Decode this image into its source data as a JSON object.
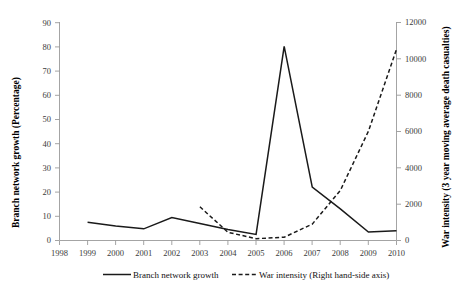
{
  "chart_data": {
    "type": "line",
    "title": "",
    "xlabel": "",
    "ylabel": "Branch network growth (Percentage)",
    "y2label": "War intensity (3 year moving average death casualties)",
    "x": [
      1998,
      1999,
      2000,
      2001,
      2002,
      2003,
      2004,
      2005,
      2006,
      2007,
      2008,
      2009,
      2010
    ],
    "xtick_labels": [
      "1998",
      "1999",
      "2000",
      "2001",
      "2002",
      "2003",
      "2004",
      "2005",
      "2006",
      "2007",
      "2008",
      "2009",
      "2010"
    ],
    "xlim": [
      1998,
      2010
    ],
    "ylim": [
      0,
      90
    ],
    "ytick_labels": [
      "0",
      "10",
      "20",
      "30",
      "40",
      "50",
      "60",
      "70",
      "80",
      "90"
    ],
    "ytick_values": [
      0,
      10,
      20,
      30,
      40,
      50,
      60,
      70,
      80,
      90
    ],
    "y2lim": [
      0,
      12000
    ],
    "y2tick_labels": [
      "0",
      "2000",
      "4000",
      "6000",
      "8000",
      "10000",
      "12000"
    ],
    "y2tick_values": [
      0,
      2000,
      4000,
      6000,
      8000,
      10000,
      12000
    ],
    "grid": false,
    "legend_position": "bottom",
    "series": [
      {
        "name": "Branch network growth",
        "axis": "left",
        "style": "solid",
        "color": "#1a1a1a",
        "x": [
          1999,
          2000,
          2001,
          2002,
          2003,
          2004,
          2005,
          2006,
          2007,
          2008,
          2009,
          2010
        ],
        "values": [
          7.5,
          6.0,
          4.8,
          9.5,
          7.0,
          4.5,
          2.5,
          80.0,
          22.0,
          13.0,
          3.5,
          4.0
        ]
      },
      {
        "name": "War intensity (Right hand-side axis)",
        "axis": "right",
        "style": "dashed",
        "color": "#1a1a1a",
        "x": [
          2003,
          2004,
          2005,
          2006,
          2007,
          2008,
          2009,
          2010
        ],
        "values": [
          1850,
          450,
          100,
          180,
          900,
          2750,
          6000,
          10500
        ]
      }
    ],
    "legend": [
      {
        "label": "Branch network growth",
        "style": "solid"
      },
      {
        "label": "War intensity (Right hand-side axis)",
        "style": "dashed"
      }
    ]
  }
}
